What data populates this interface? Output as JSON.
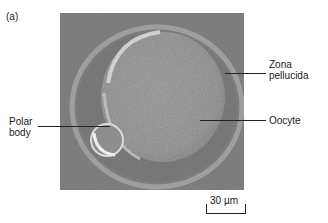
{
  "figure": {
    "panel_label": "(a)",
    "labels": {
      "zona_pellucida_line1": "Zona",
      "zona_pellucida_line2": "pellucida",
      "oocyte": "Oocyte",
      "polar_body_line1": "Polar",
      "polar_body_line2": "body"
    },
    "scale_bar": {
      "text": "30 µm"
    },
    "colors": {
      "background": "#7a7a7a",
      "oocyte": "#8e8e8e",
      "highlight": "#d9d9d9",
      "zona": "#9a9a9a"
    }
  }
}
